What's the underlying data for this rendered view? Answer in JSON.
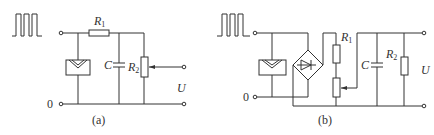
{
  "figure": {
    "panels": [
      {
        "id": "a",
        "caption": "(a)",
        "input_signal": "square-wave",
        "ground_label": "0",
        "output_label": "U",
        "components": {
          "R1": {
            "label": "R",
            "sub": "1"
          },
          "C": {
            "label": "C"
          },
          "R2": {
            "label": "R",
            "sub": "2",
            "type": "potentiometer"
          },
          "solar_cell": {
            "type": "photocell"
          }
        }
      },
      {
        "id": "b",
        "caption": "(b)",
        "input_signal": "square-wave",
        "ground_label": "0",
        "output_label": "U",
        "components": {
          "R1": {
            "label": "R",
            "sub": "1",
            "type": "resistor-with-potentiometer"
          },
          "C": {
            "label": "C"
          },
          "R2": {
            "label": "R",
            "sub": "2"
          },
          "solar_cell": {
            "type": "photocell"
          },
          "bridge": {
            "type": "diode-bridge-rectifier"
          }
        }
      }
    ]
  },
  "colors": {
    "line": "#333333",
    "background": "#ffffff"
  }
}
